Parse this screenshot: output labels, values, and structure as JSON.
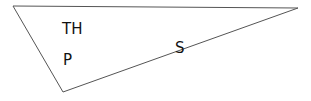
{
  "diagram": {
    "type": "triangle",
    "stroke_color": "#555555",
    "vertices": [
      [
        13,
        6
      ],
      [
        298,
        8
      ],
      [
        63,
        92
      ]
    ],
    "labels": [
      {
        "id": "th",
        "text": "TH",
        "x": 62,
        "y": 34
      },
      {
        "id": "p",
        "text": "P",
        "x": 63,
        "y": 65
      },
      {
        "id": "s",
        "text": "S",
        "x": 175,
        "y": 53
      }
    ]
  }
}
